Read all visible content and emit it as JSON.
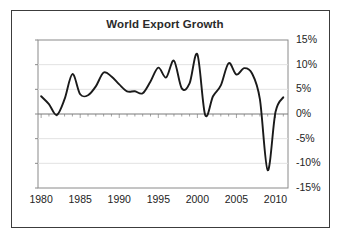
{
  "chart_data": {
    "type": "line",
    "title": "World Export Growth",
    "xlabel": "",
    "ylabel": "",
    "xlim": [
      1979.6,
      2011.6
    ],
    "ylim": [
      -15,
      15
    ],
    "grid": true,
    "legend": null,
    "y_tick_labels": [
      "15%",
      "10%",
      "5%",
      "0%",
      "-5%",
      "-10%",
      "-15%"
    ],
    "y_tick_values": [
      15,
      10,
      5,
      0,
      -5,
      -10,
      -15
    ],
    "x_tick_labels": [
      "1980",
      "1985",
      "1990",
      "1995",
      "2000",
      "2005",
      "2010"
    ],
    "x_tick_values": [
      1980,
      1985,
      1990,
      1995,
      2000,
      2005,
      2010
    ],
    "series": [
      {
        "name": "World Export Growth",
        "color": "#1a1a1a",
        "x": [
          1980,
          1981,
          1982,
          1983,
          1984,
          1985,
          1986,
          1987,
          1988,
          1989,
          1990,
          1991,
          1992,
          1993,
          1994,
          1995,
          1996,
          1997,
          1998,
          1999,
          2000,
          2001,
          2002,
          2003,
          2004,
          2005,
          2006,
          2007,
          2008,
          2009,
          2010,
          2011
        ],
        "y": [
          3.6,
          2.0,
          -0.2,
          3.0,
          8.1,
          4.0,
          3.8,
          5.6,
          8.4,
          7.6,
          6.0,
          4.6,
          4.6,
          4.2,
          6.6,
          9.4,
          7.4,
          10.8,
          5.2,
          6.2,
          12.1,
          -0.2,
          3.6,
          5.8,
          10.3,
          8.0,
          9.3,
          8.2,
          3.0,
          -11.4,
          0.4,
          3.4
        ]
      }
    ]
  },
  "axes": {
    "title": "World Export Growth"
  }
}
